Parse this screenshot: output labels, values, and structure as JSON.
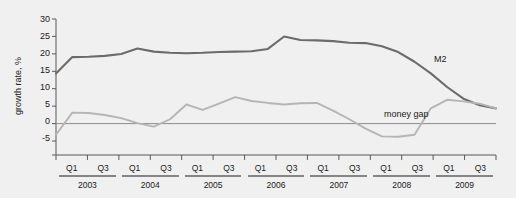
{
  "chart_data": {
    "type": "line",
    "title": "",
    "xlabel": "",
    "ylabel": "growth rate, %",
    "ylim": [
      -5,
      30
    ],
    "yticks": [
      -5,
      0,
      5,
      10,
      15,
      20,
      25,
      30
    ],
    "ytick_labels": [
      "-5",
      "0",
      "5",
      "10",
      "15",
      "20",
      "25",
      "30"
    ],
    "grid": false,
    "legend_position": "inline-annotation",
    "x_quarter_labels": [
      "Q1",
      "Q3"
    ],
    "x_groups": [
      {
        "year": "2003",
        "quarters": [
          "Q1",
          "Q2",
          "Q3",
          "Q4"
        ]
      },
      {
        "year": "2004",
        "quarters": [
          "Q1",
          "Q2",
          "Q3",
          "Q4"
        ]
      },
      {
        "year": "2005",
        "quarters": [
          "Q1",
          "Q2",
          "Q3",
          "Q4"
        ]
      },
      {
        "year": "2006",
        "quarters": [
          "Q1",
          "Q2",
          "Q3",
          "Q4"
        ]
      },
      {
        "year": "2007",
        "quarters": [
          "Q1",
          "Q2",
          "Q3",
          "Q4"
        ]
      },
      {
        "year": "2008",
        "quarters": [
          "Q1",
          "Q2",
          "Q3",
          "Q4"
        ]
      },
      {
        "year": "2009",
        "quarters": [
          "Q1",
          "Q2",
          "Q3",
          "Q4"
        ]
      }
    ],
    "x": [
      "2003Q1",
      "2003Q2",
      "2003Q3",
      "2003Q4",
      "2004Q1",
      "2004Q2",
      "2004Q3",
      "2004Q4",
      "2005Q1",
      "2005Q2",
      "2005Q3",
      "2005Q4",
      "2006Q1",
      "2006Q2",
      "2006Q3",
      "2006Q4",
      "2007Q1",
      "2007Q2",
      "2007Q3",
      "2007Q4",
      "2008Q1",
      "2008Q2",
      "2008Q3",
      "2008Q4",
      "2009Q1",
      "2009Q2",
      "2009Q3",
      "2009Q4"
    ],
    "series": [
      {
        "name": "M2",
        "color": "#6b6b6b",
        "label_text": "M2",
        "values": [
          16.0,
          20.2,
          20.3,
          20.5,
          21.0,
          22.4,
          21.6,
          21.3,
          21.2,
          21.3,
          21.5,
          21.6,
          21.7,
          22.3,
          25.5,
          24.6,
          24.5,
          24.3,
          23.9,
          23.8,
          23.0,
          21.5,
          19.0,
          16.0,
          12.5,
          9.5,
          7.8,
          7.0
        ]
      },
      {
        "name": "money gap",
        "color": "#b5b5b5",
        "label_text": "money gap",
        "values": [
          0.2,
          5.9,
          5.8,
          5.3,
          4.5,
          3.2,
          2.3,
          4.2,
          8.0,
          6.6,
          8.2,
          9.9,
          8.9,
          8.4,
          8.0,
          8.3,
          8.4,
          6.4,
          4.2,
          1.8,
          -0.2,
          -0.3,
          0.2,
          7.0,
          9.2,
          8.8,
          8.2,
          7.0
        ]
      }
    ],
    "annotations": [
      {
        "text": "M2",
        "x_pixel": 434,
        "y_pixel": 62
      },
      {
        "text": "money gap",
        "x_pixel": 384,
        "y_pixel": 117
      }
    ]
  }
}
